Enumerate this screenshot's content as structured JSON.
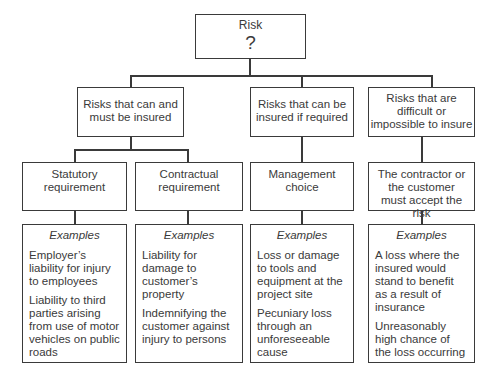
{
  "root": {
    "label": "Risk",
    "symbol": "?"
  },
  "categories": [
    {
      "label": "Risks that can and must be insured"
    },
    {
      "label": "Risks that can be insured if required"
    },
    {
      "label": "Risks that are difficult or impossible to insure"
    }
  ],
  "subcategories": [
    {
      "label": "Statutory requirement"
    },
    {
      "label": "Contractual requirement"
    },
    {
      "label": "Management choice"
    },
    {
      "label": "The contractor or the customer must accept the risk"
    }
  ],
  "examples": [
    {
      "title": "Examples",
      "items": [
        "Employer’s liability for injury to employees",
        "Liability to third parties arising from use of motor vehicles on public roads"
      ]
    },
    {
      "title": "Examples",
      "items": [
        "Liability for damage to customer’s property",
        "Indemnifying the customer against injury to persons"
      ]
    },
    {
      "title": "Examples",
      "items": [
        "Loss or damage to tools and equipment at the project site",
        "Pecuniary loss through an unforeseeable cause"
      ]
    },
    {
      "title": "Examples",
      "items": [
        "A loss where the insured would stand to benefit as a result of insurance",
        "Unreasonably high chance of the loss occurring"
      ]
    }
  ]
}
